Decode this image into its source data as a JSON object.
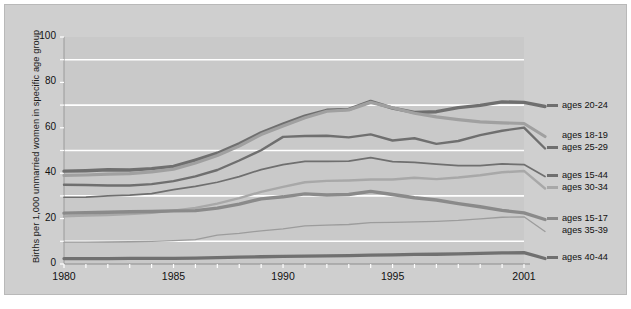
{
  "chart_data": {
    "type": "line",
    "title": "",
    "xlabel": "",
    "ylabel": "Births per 1,000 unmarried women in specific age group",
    "xlim": [
      1980,
      2001
    ],
    "ylim": [
      0,
      100
    ],
    "ytick_labels": [
      "0",
      "20",
      "40",
      "60",
      "80",
      "100"
    ],
    "ytick_values": [
      0,
      20,
      40,
      60,
      80,
      100
    ],
    "xtick_labels": [
      "1980",
      "1985",
      "1990",
      "1995",
      "2001"
    ],
    "xtick_values": [
      1980,
      1985,
      1990,
      1995,
      2001
    ],
    "gridlines": [
      10,
      30,
      50,
      70,
      90
    ],
    "grid": true,
    "grid_color": "#ffffff",
    "plot_bg": "#c9c9c9",
    "legend_position": "right",
    "x": [
      1980,
      1981,
      1982,
      1983,
      1984,
      1985,
      1986,
      1987,
      1988,
      1989,
      1990,
      1991,
      1992,
      1993,
      1994,
      1995,
      1996,
      1997,
      1998,
      1999,
      2000,
      2001
    ],
    "series": [
      {
        "name": "ages 20-24",
        "color": "#6f6f6f",
        "width": 3.4,
        "values": [
          40.9,
          41.1,
          41.5,
          41.4,
          42.0,
          43.0,
          45.8,
          48.8,
          53.0,
          57.8,
          61.6,
          65.1,
          67.7,
          68.1,
          71.6,
          68.7,
          66.8,
          67.1,
          68.9,
          69.9,
          71.4,
          71.2
        ]
      },
      {
        "name": "ages 18-19",
        "color": "#a0a0a0",
        "width": 3.2,
        "values": [
          39.0,
          39.2,
          39.6,
          39.8,
          40.6,
          41.8,
          44.5,
          47.8,
          52.0,
          57.0,
          60.8,
          64.4,
          67.3,
          67.9,
          71.2,
          68.8,
          66.4,
          64.8,
          63.6,
          62.6,
          62.2,
          61.9
        ]
      },
      {
        "name": "ages 25-29",
        "color": "#6f6f6f",
        "width": 2.4,
        "values": [
          34.9,
          34.8,
          34.6,
          34.6,
          35.2,
          36.5,
          38.6,
          41.4,
          45.6,
          50.1,
          56.0,
          56.4,
          56.5,
          55.8,
          57.1,
          54.4,
          55.4,
          52.9,
          54.2,
          56.8,
          58.7,
          60.1
        ]
      },
      {
        "name": "ages 15-44",
        "color": "#6f6f6f",
        "width": 1.7,
        "values": [
          29.4,
          29.5,
          30.0,
          30.3,
          31.0,
          32.8,
          34.2,
          36.0,
          38.5,
          41.6,
          43.8,
          45.2,
          45.2,
          45.3,
          46.9,
          45.1,
          44.8,
          44.0,
          43.3,
          43.3,
          44.1,
          43.8
        ]
      },
      {
        "name": "ages 30-34",
        "color": "#a8a8a8",
        "width": 2.4,
        "values": [
          21.0,
          21.3,
          21.6,
          22.0,
          22.6,
          23.5,
          24.7,
          26.6,
          29.0,
          31.8,
          34.0,
          36.0,
          36.6,
          36.8,
          37.2,
          37.2,
          38.0,
          37.4,
          38.1,
          39.1,
          40.4,
          41.0
        ]
      },
      {
        "name": "ages 15-17",
        "color": "#8a8a8a",
        "width": 3.4,
        "values": [
          22.4,
          22.6,
          22.8,
          23.0,
          23.1,
          23.4,
          23.5,
          24.6,
          26.4,
          28.7,
          29.6,
          30.9,
          30.4,
          30.6,
          32.0,
          30.6,
          29.2,
          28.2,
          26.6,
          25.2,
          23.6,
          22.5
        ]
      },
      {
        "name": "ages 35-39",
        "color": "#9c9c9c",
        "width": 1.3,
        "values": [
          9.6,
          9.6,
          9.7,
          9.8,
          10.0,
          10.3,
          10.7,
          12.7,
          13.5,
          14.6,
          15.5,
          16.8,
          17.1,
          17.4,
          18.2,
          18.3,
          18.6,
          18.8,
          19.2,
          19.9,
          20.6,
          20.8
        ]
      },
      {
        "name": "ages 40-44",
        "color": "#707070",
        "width": 3.3,
        "values": [
          2.4,
          2.4,
          2.4,
          2.5,
          2.5,
          2.5,
          2.6,
          2.8,
          3.0,
          3.2,
          3.4,
          3.5,
          3.6,
          3.7,
          3.9,
          4.0,
          4.2,
          4.3,
          4.5,
          4.7,
          4.9,
          5.0
        ]
      }
    ],
    "legend": [
      {
        "label": "ages 20-24",
        "color": "#6f6f6f",
        "swatch": true,
        "y": 101
      },
      {
        "label": "ages 18-19",
        "color": "#a0a0a0",
        "swatch": false,
        "y": 131
      },
      {
        "label": "ages 25-29",
        "color": "#6f6f6f",
        "swatch": true,
        "y": 143
      },
      {
        "label": "ages 15-44",
        "color": "#6f6f6f",
        "swatch": true,
        "y": 171
      },
      {
        "label": "ages 30-34",
        "color": "#a8a8a8",
        "swatch": true,
        "y": 183
      },
      {
        "label": "ages 15-17",
        "color": "#8a8a8a",
        "swatch": true,
        "y": 214
      },
      {
        "label": "ages 35-39",
        "color": "#9c9c9c",
        "swatch": false,
        "y": 226
      },
      {
        "label": "ages 40-44",
        "color": "#707070",
        "swatch": true,
        "y": 253
      }
    ]
  }
}
